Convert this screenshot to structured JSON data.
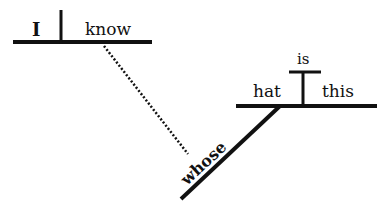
{
  "diagram": {
    "type": "sentence-diagram",
    "colors": {
      "ink": "#111111",
      "background": "#ffffff"
    },
    "main_clause": {
      "subject": "I",
      "verb": "know"
    },
    "relative_clause": {
      "subject": "hat",
      "modifier": "whose",
      "verb": "this",
      "predicate_above": "is"
    },
    "connector": {
      "style": "dotted",
      "from": "know",
      "to": "whose"
    }
  }
}
